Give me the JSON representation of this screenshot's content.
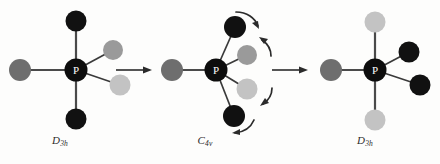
{
  "figure": {
    "background_color": "#fdfdfc",
    "center_atom_label": "P",
    "center_atom_color": "#0d0d0d",
    "center_atom_text_color": "#ffffff",
    "bond_color": "#3a3a3a",
    "arrow_color": "#2b2b2b",
    "ligand_colors": {
      "black": "#111111",
      "dark_gray": "#6e6e6e",
      "mid_gray": "#9a9a9a",
      "light_gray": "#c3c3c3"
    }
  },
  "chart_data": {
    "type": "diagram",
    "xlabel": "",
    "ylabel": "",
    "legend_position": "none",
    "grid": false,
    "structures": [
      {
        "id": "structure-left",
        "label": "D",
        "label_sub": "3h",
        "geometry": "trigonal bipyramidal",
        "center": {
          "x": 76,
          "y": 70,
          "label": "P"
        },
        "ligands": [
          {
            "name": "axial-top",
            "x": 76,
            "y": 21,
            "color": "#111111",
            "r": 10.5
          },
          {
            "name": "axial-bottom",
            "x": 76,
            "y": 119,
            "color": "#111111",
            "r": 10.5
          },
          {
            "name": "equatorial-left",
            "x": 20,
            "y": 70,
            "color": "#6e6e6e",
            "r": 11
          },
          {
            "name": "equatorial-upper-right",
            "x": 113,
            "y": 50,
            "color": "#9a9a9a",
            "r": 10
          },
          {
            "name": "equatorial-lower-right",
            "x": 120,
            "y": 85,
            "color": "#c3c3c3",
            "r": 10.5
          }
        ]
      },
      {
        "id": "structure-middle",
        "label": "C",
        "label_sub": "4v",
        "geometry": "square pyramidal",
        "center": {
          "x": 216,
          "y": 70,
          "label": "P"
        },
        "ligands": [
          {
            "name": "apical-left",
            "x": 172,
            "y": 70,
            "color": "#6e6e6e",
            "r": 11
          },
          {
            "name": "basal-upper",
            "x": 235,
            "y": 27,
            "color": "#111111",
            "r": 11
          },
          {
            "name": "basal-mid-upper",
            "x": 247,
            "y": 55,
            "color": "#9a9a9a",
            "r": 10
          },
          {
            "name": "basal-mid-lower",
            "x": 247,
            "y": 89,
            "color": "#c3c3c3",
            "r": 10.5
          },
          {
            "name": "basal-lower",
            "x": 234,
            "y": 116,
            "color": "#111111",
            "r": 11
          }
        ],
        "rotation_arrows": [
          {
            "name": "curved-arrow-top",
            "direction": "clockwise"
          },
          {
            "name": "curved-arrow-upper-mid",
            "direction": "clockwise"
          },
          {
            "name": "curved-arrow-lower-mid",
            "direction": "counterclockwise"
          },
          {
            "name": "curved-arrow-bottom",
            "direction": "counterclockwise"
          }
        ]
      },
      {
        "id": "structure-right",
        "label": "D",
        "label_sub": "3h",
        "geometry": "trigonal bipyramidal",
        "center": {
          "x": 375,
          "y": 70,
          "label": "P"
        },
        "ligands": [
          {
            "name": "axial-top",
            "x": 375,
            "y": 22,
            "color": "#c3c3c3",
            "r": 10.5
          },
          {
            "name": "axial-bottom",
            "x": 375,
            "y": 120,
            "color": "#c3c3c3",
            "r": 10.5
          },
          {
            "name": "equatorial-left",
            "x": 331,
            "y": 70,
            "color": "#6e6e6e",
            "r": 11
          },
          {
            "name": "equatorial-upper-right",
            "x": 409,
            "y": 52,
            "color": "#111111",
            "r": 10.5
          },
          {
            "name": "equatorial-lower-right",
            "x": 420,
            "y": 85,
            "color": "#111111",
            "r": 10.5
          }
        ]
      }
    ],
    "reaction_arrows": [
      {
        "name": "reaction-arrow-1",
        "x1": 116,
        "y": 70,
        "x2": 152,
        "direction": "right"
      },
      {
        "name": "reaction-arrow-2",
        "x1": 272,
        "y": 70,
        "x2": 308,
        "direction": "right"
      }
    ]
  }
}
